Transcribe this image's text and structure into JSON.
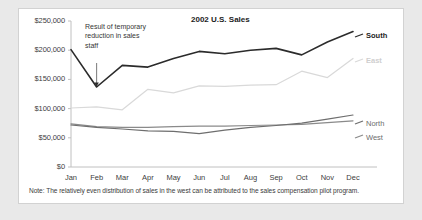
{
  "card": {
    "title": "2002 U.S. Sales",
    "annotation": "Result of temporary reduction in sales staff",
    "note": "Note: The relatively even distribution of sales in the west can be attributed to the sales compensation pilot program."
  },
  "labels": {
    "south": "South",
    "east": "East",
    "north": "North",
    "west": "West"
  },
  "colors": {
    "south": "#2b2b2b",
    "east": "#d9d9d9",
    "north": "#6e6e6e",
    "west": "#8a8a8a",
    "axis": "#c0c0c0",
    "text": "#404040",
    "card_bg": "#ffffff",
    "page_bg": "#e9e9e9"
  },
  "chart_data": {
    "type": "line",
    "title": "2002 U.S. Sales",
    "xlabel": "",
    "ylabel": "",
    "categories": [
      "Jan",
      "Feb",
      "Mar",
      "Apr",
      "May",
      "Jun",
      "Jul",
      "Aug",
      "Sep",
      "Oct",
      "Nov",
      "Dec"
    ],
    "ylim": [
      0,
      250000
    ],
    "yticks": [
      0,
      50000,
      100000,
      150000,
      200000,
      250000
    ],
    "ytick_labels": [
      "$0",
      "$50,000",
      "$100,000",
      "$150,000",
      "$200,000",
      "$250,000"
    ],
    "grid": false,
    "legend": "right-end-of-line",
    "annotations": [
      {
        "text": "Result of temporary reduction in sales staff",
        "points_to_category": "Feb",
        "points_to_series": "South",
        "points_to_value": 137000
      },
      {
        "text": "Note: The relatively even distribution of sales in the west can be attributed to the sales compensation pilot program.",
        "type": "footnote"
      }
    ],
    "series": [
      {
        "name": "South",
        "color": "#2b2b2b",
        "values": [
          201000,
          137000,
          174000,
          171000,
          186000,
          198000,
          194000,
          200000,
          203000,
          192000,
          214000,
          232000
        ]
      },
      {
        "name": "East",
        "color": "#d9d9d9",
        "values": [
          101000,
          103000,
          98000,
          133000,
          127000,
          139000,
          138000,
          140000,
          141000,
          164000,
          153000,
          186000
        ]
      },
      {
        "name": "North",
        "color": "#6e6e6e",
        "values": [
          72000,
          68000,
          65000,
          62000,
          61000,
          57000,
          63000,
          68000,
          71000,
          75000,
          82000,
          89000
        ]
      },
      {
        "name": "West",
        "color": "#8a8a8a",
        "values": [
          74000,
          69000,
          68000,
          68000,
          69000,
          70000,
          70000,
          71000,
          72000,
          73000,
          76000,
          79000
        ]
      }
    ]
  }
}
